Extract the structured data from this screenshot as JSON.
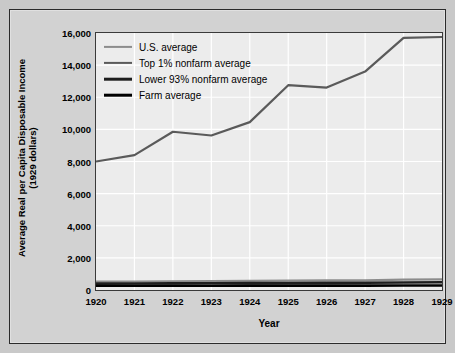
{
  "chart_data": {
    "type": "line",
    "title": "",
    "xlabel": "Year",
    "ylabel_line1": "Average Real per Capita Disposable Income",
    "ylabel_line2": "(1929 dollars)",
    "x": [
      1920,
      1921,
      1922,
      1923,
      1924,
      1925,
      1926,
      1927,
      1928,
      1929
    ],
    "xtick_labels": [
      "1920",
      "1921",
      "1922",
      "1923",
      "1924",
      "1925",
      "1926",
      "1927",
      "1928",
      "1929"
    ],
    "ytick_labels": [
      "0",
      "2,000",
      "4,000",
      "6,000",
      "8,000",
      "10,000",
      "12,000",
      "14,000",
      "16,000"
    ],
    "ytick_values": [
      0,
      2000,
      4000,
      6000,
      8000,
      10000,
      12000,
      14000,
      16000
    ],
    "ylim": [
      0,
      16000
    ],
    "xlim": [
      1920,
      1929
    ],
    "grid": true,
    "legend_position": "upper left",
    "series": [
      {
        "name": "U.S. average",
        "color": "#8c8c8c",
        "width": 2.2,
        "values": [
          520,
          528,
          545,
          560,
          570,
          585,
          595,
          605,
          640,
          660
        ]
      },
      {
        "name": "Top 1% nonfarm average",
        "color": "#5a5a5a",
        "width": 2.2,
        "values": [
          8000,
          8400,
          9850,
          9620,
          10450,
          12750,
          12600,
          13600,
          15700,
          15750
        ]
      },
      {
        "name": "Lower 93% nonfarm average",
        "color": "#1e1e1e",
        "width": 2.6,
        "values": [
          400,
          405,
          415,
          420,
          428,
          438,
          445,
          452,
          470,
          480
        ]
      },
      {
        "name": "Farm average",
        "color": "#000000",
        "width": 2.6,
        "values": [
          270,
          262,
          265,
          268,
          272,
          275,
          272,
          270,
          278,
          282
        ]
      }
    ]
  },
  "legend": {
    "items": [
      {
        "label": "U.S. average"
      },
      {
        "label": "Top 1% nonfarm average"
      },
      {
        "label": "Lower 93% nonfarm average"
      },
      {
        "label": "Farm average"
      }
    ]
  }
}
